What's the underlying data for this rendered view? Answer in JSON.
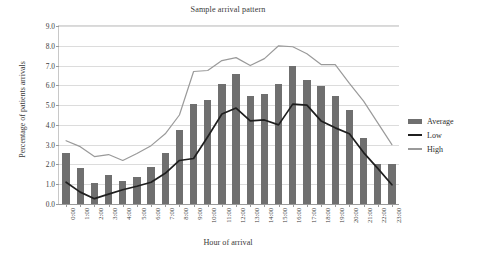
{
  "chart_data": {
    "type": "bar",
    "title": "Sample arrival pattern",
    "xlabel": "Hour of arrival",
    "ylabel": "Percentage of patients arrivals",
    "categories": [
      "0:00",
      "1:00",
      "2:00",
      "3:00",
      "4:00",
      "5:00",
      "6:00",
      "7:00",
      "8:00",
      "9:00",
      "10:00",
      "11:00",
      "12:00",
      "13:00",
      "14:00",
      "15:00",
      "16:00",
      "17:00",
      "18:00",
      "19:00",
      "20:00",
      "21:00",
      "22:00",
      "23:00"
    ],
    "ylim": [
      0.0,
      9.0
    ],
    "ytick_labels": [
      "0.0",
      "1.0",
      "2.0",
      "3.0",
      "4.0",
      "5.0",
      "6.0",
      "7.0",
      "8.0",
      "9.0"
    ],
    "ytick_values": [
      0.0,
      1.0,
      2.0,
      3.0,
      4.0,
      5.0,
      6.0,
      7.0,
      8.0,
      9.0
    ],
    "grid": true,
    "legend_position": "right",
    "series": [
      {
        "name": "Average",
        "kind": "bar",
        "color": "#6f6f6f",
        "values": [
          2.6,
          1.8,
          1.05,
          1.45,
          1.15,
          1.35,
          1.85,
          2.6,
          3.75,
          5.05,
          5.25,
          6.05,
          6.55,
          5.45,
          5.55,
          6.05,
          7.0,
          6.25,
          5.95,
          5.45,
          4.75,
          3.35,
          2.0,
          2.0
        ]
      },
      {
        "name": "Low",
        "kind": "line",
        "color": "#1f1f1f",
        "values": [
          1.1,
          0.6,
          0.27,
          0.5,
          0.72,
          0.9,
          1.1,
          1.55,
          2.2,
          2.3,
          3.4,
          4.55,
          4.85,
          4.2,
          4.25,
          4.0,
          5.05,
          5.0,
          4.2,
          3.85,
          3.55,
          2.6,
          1.8,
          0.97
        ]
      },
      {
        "name": "High",
        "kind": "line",
        "color": "#9a9a9a",
        "values": [
          3.2,
          2.9,
          2.4,
          2.5,
          2.2,
          2.55,
          2.95,
          3.55,
          4.5,
          6.7,
          6.75,
          7.25,
          7.4,
          7.0,
          7.35,
          8.0,
          7.95,
          7.6,
          7.05,
          7.05,
          6.1,
          5.2,
          4.1,
          3.0
        ]
      }
    ]
  },
  "legend": {
    "items": [
      {
        "label": "Average",
        "color": "#6f6f6f",
        "style": "bar"
      },
      {
        "label": "Low",
        "color": "#1f1f1f",
        "style": "line"
      },
      {
        "label": "High",
        "color": "#9a9a9a",
        "style": "line"
      }
    ]
  }
}
